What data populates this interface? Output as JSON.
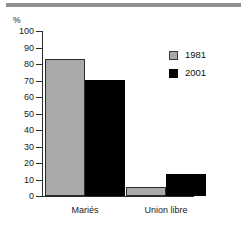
{
  "figure": {
    "top_rule_color": "#8f8f8f",
    "unit_label": "%",
    "series_colors": {
      "1981": "#a9a9a9",
      "2001": "#000000"
    }
  },
  "legend": {
    "position": "top-right",
    "entries": [
      {
        "label": "1981",
        "swatch": "gray-square-swatch"
      },
      {
        "label": "2001",
        "swatch": "black-square-swatch"
      }
    ]
  },
  "chart_data": {
    "type": "bar",
    "title": "",
    "subtitle": "",
    "xlabel": "",
    "ylabel": "%",
    "categories": [
      "Mariés",
      "Union libre"
    ],
    "series": [
      {
        "name": "1981",
        "color": "#a9a9a9",
        "values": [
          83,
          5.5
        ]
      },
      {
        "name": "2001",
        "color": "#000000",
        "values": [
          70.5,
          13.5
        ]
      }
    ],
    "ylim": [
      0,
      100
    ],
    "ytick_labels": [
      "100",
      "90",
      "80",
      "70",
      "60",
      "50",
      "40",
      "30",
      "20",
      "10",
      "0"
    ],
    "ytick_values": [
      100,
      90,
      80,
      70,
      60,
      50,
      40,
      30,
      20,
      10,
      0
    ],
    "grid": false,
    "legend_position": "upper right",
    "annotations": []
  }
}
